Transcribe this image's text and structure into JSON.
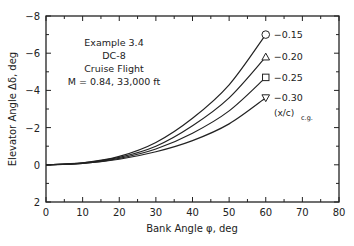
{
  "chart_data": {
    "type": "line",
    "title": "",
    "annotation": [
      "Example 3.4",
      "DC-8",
      "Cruise Flight",
      "M = 0.84, 33,000 ft"
    ],
    "xlabel": "Bank Angle φ, deg",
    "ylabel": "Elevator Angle Δδ, deg",
    "xlim": [
      0,
      80
    ],
    "ylim": [
      2,
      -8
    ],
    "xticks": [
      0,
      10,
      20,
      30,
      40,
      50,
      60,
      70,
      80
    ],
    "yticks": [
      -8,
      -6,
      -4,
      -2,
      0,
      2
    ],
    "x": [
      0,
      10,
      20,
      30,
      40,
      50,
      60
    ],
    "legend_title": "(x/c)c.g.",
    "series": [
      {
        "name": "-0.15",
        "marker": "circle",
        "values": [
          0,
          -0.1,
          -0.45,
          -1.2,
          -2.5,
          -4.3,
          -7.0
        ]
      },
      {
        "name": "-0.20",
        "marker": "triangle",
        "values": [
          0,
          -0.1,
          -0.4,
          -1.0,
          -2.1,
          -3.6,
          -5.8
        ]
      },
      {
        "name": "-0.25",
        "marker": "square",
        "values": [
          0,
          -0.08,
          -0.35,
          -0.85,
          -1.7,
          -2.9,
          -4.7
        ]
      },
      {
        "name": "-0.30",
        "marker": "triangle-down",
        "values": [
          0,
          -0.07,
          -0.3,
          -0.7,
          -1.3,
          -2.2,
          -3.6
        ]
      }
    ],
    "grid": false,
    "legend_position": "inline-right"
  }
}
